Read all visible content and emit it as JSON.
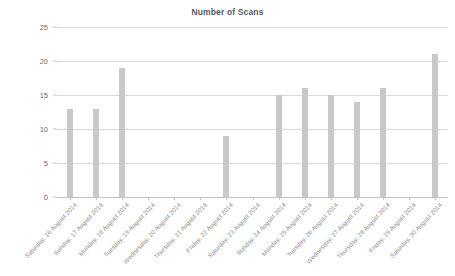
{
  "chart_data": {
    "type": "bar",
    "title": "Number of Scans",
    "xlabel": "",
    "ylabel": "",
    "ylim": [
      0,
      25
    ],
    "yticks": [
      0,
      5,
      10,
      15,
      20,
      25
    ],
    "grid": true,
    "legend": "none",
    "bar_color": "#c9c9c9",
    "gridline_color": "#d9d9d9",
    "title_color": "#5a5a5a",
    "tick_label_color": "#6b6b6b",
    "category_label_color": "#8d8d8d",
    "categories": [
      "Saturday, 16 August 2014",
      "Sunday, 17 August 2014",
      "Monday, 18 August 2014",
      "Tuesday, 19 August 2014",
      "Wednesday, 20 August 2014",
      "Thursday, 21 August 2014",
      "Friday, 22 August 2014",
      "Saturday, 23 August 2014",
      "Sunday, 24 August 2014",
      "Monday, 25 August 2014",
      "Tuesday, 26 August 2014",
      "Wednesday, 27 August 2014",
      "Thursday, 28 August 2014",
      "Friday, 29 August 2014",
      "Saturday, 30 August 2014"
    ],
    "values": [
      13,
      13,
      19,
      0,
      0,
      0,
      9,
      0,
      15,
      16,
      15,
      14,
      16,
      0,
      21
    ]
  }
}
